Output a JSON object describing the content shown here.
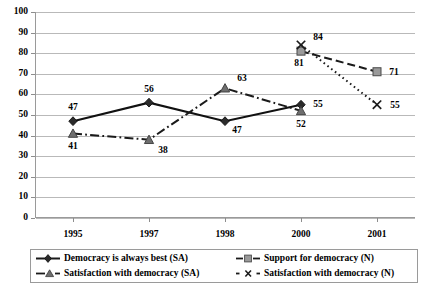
{
  "chart_data": {
    "type": "line",
    "title": "",
    "xlabel": "",
    "ylabel": "",
    "categories": [
      "1995",
      "1997",
      "1998",
      "2000",
      "2001"
    ],
    "ylim": [
      0,
      100
    ],
    "ytick_step": 10,
    "yticks": [
      "0",
      "10",
      "20",
      "30",
      "40",
      "50",
      "60",
      "70",
      "80",
      "90",
      "100"
    ],
    "grid": "horizontal",
    "legend_position": "bottom",
    "series": [
      {
        "name": "Democracy is always best (SA)",
        "marker": "diamond",
        "line_style": "solid",
        "color": "#1a1a1a",
        "values": [
          47,
          56,
          47,
          55,
          null
        ],
        "labels": [
          "47",
          "56",
          "47",
          "55",
          ""
        ]
      },
      {
        "name": "Satisfaction with democracy (SA)",
        "marker": "triangle",
        "line_style": "dash-dot",
        "color": "#6e6e6e",
        "values": [
          41,
          38,
          63,
          52,
          null
        ],
        "labels": [
          "41",
          "38",
          "63",
          "52",
          ""
        ]
      },
      {
        "name": "Support for democracy (N)",
        "marker": "square",
        "line_style": "dashed",
        "color": "#8a8a8a",
        "values": [
          null,
          null,
          null,
          81,
          71
        ],
        "labels": [
          "",
          "",
          "",
          "81",
          "71"
        ]
      },
      {
        "name": "Satisfaction with democracy (N)",
        "marker": "x",
        "line_style": "dotted",
        "color": "#1a1a1a",
        "values": [
          null,
          null,
          null,
          84,
          55
        ],
        "labels": [
          "",
          "",
          "",
          "84",
          "55"
        ]
      }
    ]
  },
  "legend": {
    "items": [
      "Democracy is always best (SA)",
      "Support for democracy (N)",
      "Satisfaction with democracy (SA)",
      "Satisfaction with democracy (N)"
    ]
  },
  "colors": {
    "grid": "#b9b9b9",
    "axis": "#9a9a9a",
    "text": "#000000",
    "background": "#ffffff"
  }
}
